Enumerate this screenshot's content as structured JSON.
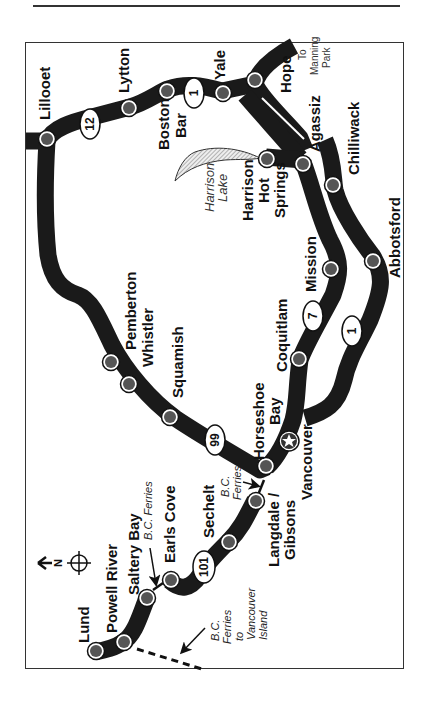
{
  "map": {
    "orientation": "rotated 90° counter-clockwise; north arrow points left",
    "colors": {
      "road": "#1a1a1a",
      "town_dot": "#555555",
      "frame": "#333333",
      "lake_hatch": "#999999"
    },
    "north_label": "N",
    "towns": {
      "lillooet": "Lillooet",
      "lytton": "Lytton",
      "boston_bar_1": "Boston",
      "boston_bar_2": "Bar",
      "yale": "Yale",
      "hope": "Hope",
      "agassiz": "Agassiz",
      "chilliwack": "Chilliwack",
      "harrison_1": "Harrison",
      "harrison_2": "Hot",
      "harrison_3": "Springs",
      "mission": "Mission",
      "abbotsford": "Abbotsford",
      "coquitlam": "Coquitlam",
      "pemberton": "Pemberton",
      "whistler": "Whistler",
      "squamish": "Squamish",
      "horseshoe_1": "Horseshoe",
      "horseshoe_2": "Bay",
      "vancouver": "Vancouver",
      "langdale_1": "Langdale /",
      "langdale_2": "Gibsons",
      "sechelt": "Sechelt",
      "earls_cove": "Earls Cove",
      "saltery_bay": "Saltery Bay",
      "powell_river": "Powell River",
      "lund": "Lund"
    },
    "annotations": {
      "lake_1": "Harrison",
      "lake_2": "Lake",
      "manning_1": "To",
      "manning_2": "Manning",
      "manning_3": "Park",
      "ferry_hb_1": "B.C.",
      "ferry_hb_2": "Ferries",
      "ferry_sb": "B.C. Ferries",
      "ferry_vi_1": "B.C.",
      "ferry_vi_2": "Ferries",
      "ferry_vi_3": "to",
      "ferry_vi_4": "Vancouver",
      "ferry_vi_5": "Island"
    },
    "highway_shields": {
      "hwy12": "12",
      "hwy1_north": "1",
      "hwy99": "99",
      "hwy7": "7",
      "hwy1_south": "1",
      "hwy101": "101"
    }
  }
}
